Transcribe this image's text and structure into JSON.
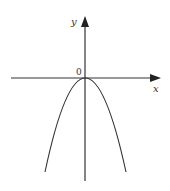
{
  "diagram": {
    "type": "function-graph",
    "axes": {
      "x_label": "x",
      "y_label": "y",
      "origin_label": "0"
    },
    "curve": {
      "shape": "parabola",
      "opens": "down",
      "vertex": [
        0,
        0
      ]
    },
    "colors": {
      "line": "#333333",
      "background": "#ffffff"
    }
  }
}
